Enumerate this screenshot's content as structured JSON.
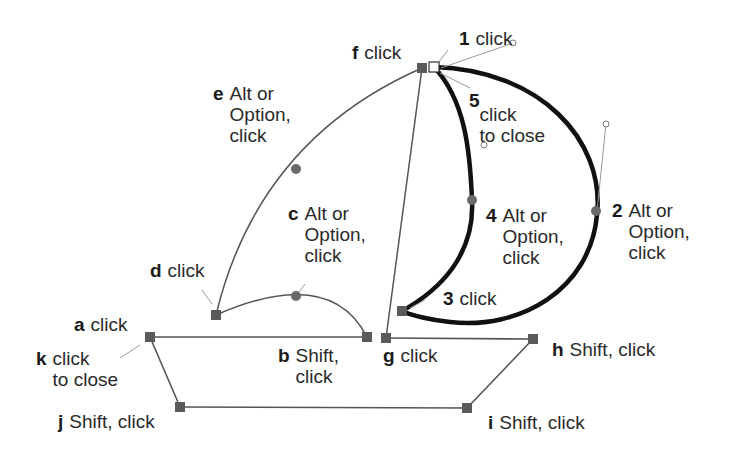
{
  "colors": {
    "background": "#ffffff",
    "thin_path": "#555555",
    "thick_path": "#111111",
    "anchor": "#5a5a5a",
    "handle": "#6a6a6a",
    "leader": "#999999",
    "text": "#2a2a2a"
  },
  "boat": {
    "labels": [
      {
        "id": "a",
        "letter": "a",
        "lines": [
          "click"
        ]
      },
      {
        "id": "b",
        "letter": "b",
        "lines": [
          "Shift,",
          "click"
        ]
      },
      {
        "id": "c",
        "letter": "c",
        "lines": [
          "Alt or",
          "Option,",
          "click"
        ]
      },
      {
        "id": "d",
        "letter": "d",
        "lines": [
          "click"
        ]
      },
      {
        "id": "e",
        "letter": "e",
        "lines": [
          "Alt or",
          "Option,",
          "click"
        ]
      },
      {
        "id": "f",
        "letter": "f",
        "lines": [
          "click"
        ]
      },
      {
        "id": "g",
        "letter": "g",
        "lines": [
          "click"
        ]
      },
      {
        "id": "h",
        "letter": "h",
        "lines": [
          "Shift, click"
        ]
      },
      {
        "id": "i",
        "letter": "i",
        "lines": [
          "Shift, click"
        ]
      },
      {
        "id": "j",
        "letter": "j",
        "lines": [
          "Shift, click"
        ]
      },
      {
        "id": "k",
        "letter": "k",
        "lines": [
          "click",
          "to close"
        ]
      }
    ]
  },
  "moon": {
    "labels": [
      {
        "id": "1",
        "letter": "1",
        "lines": [
          "click"
        ]
      },
      {
        "id": "2",
        "letter": "2",
        "lines": [
          "Alt or",
          "Option,",
          "click"
        ]
      },
      {
        "id": "3",
        "letter": "3",
        "lines": [
          "click"
        ]
      },
      {
        "id": "4",
        "letter": "4",
        "lines": [
          "Alt or",
          "Option,",
          "click"
        ]
      },
      {
        "id": "5",
        "letter": "5",
        "lines": [
          "click",
          "to close"
        ]
      }
    ]
  }
}
